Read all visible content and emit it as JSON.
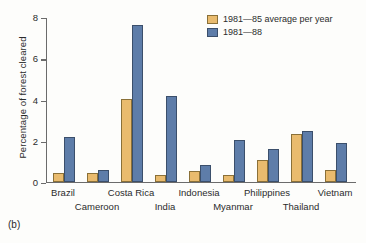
{
  "caption": "(b)",
  "legend": {
    "position": "top-right",
    "entries": [
      {
        "label": "1981—85 average per year",
        "color": "#e9bb6e",
        "swatch_name": "legend-swatch-1981-85"
      },
      {
        "label": "1981—88",
        "color": "#5e7da9",
        "swatch_name": "legend-swatch-1981-88"
      }
    ]
  },
  "chart_data": {
    "type": "bar",
    "title": "",
    "xlabel": "",
    "ylabel": "Percentage of forest cleared",
    "ylim": [
      0,
      8
    ],
    "yticks": [
      0,
      2,
      4,
      6,
      8
    ],
    "ytick_labels": [
      "0",
      "2",
      "4",
      "6",
      "8"
    ],
    "grid": false,
    "legend_position": "top-right",
    "categories": [
      "Brazil",
      "Cameroon",
      "Costa Rica",
      "India",
      "Indonesia",
      "Myanmar",
      "Philippines",
      "Thailand",
      "Vietnam"
    ],
    "series": [
      {
        "name": "1981—85 average per year",
        "color": "#e9bb6e",
        "values": [
          0.4,
          0.4,
          4.0,
          0.3,
          0.5,
          0.3,
          1.05,
          2.3,
          0.55
        ]
      },
      {
        "name": "1981—88",
        "color": "#5e7da9",
        "values": [
          2.15,
          0.55,
          7.6,
          4.15,
          0.8,
          2.0,
          1.6,
          2.45,
          1.85
        ]
      }
    ]
  },
  "axis": {
    "colors": {
      "axis_line": "#6b6b6b",
      "text": "#2b2b2b",
      "background": "#fdfdfb"
    }
  }
}
